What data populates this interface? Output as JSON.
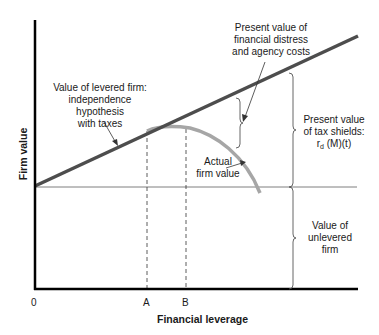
{
  "diagram": {
    "type": "capital-structure-tradeoff",
    "axes": {
      "x_label": "Financial leverage",
      "y_label": "Firm value",
      "x_ticks": [
        "0",
        "A",
        "B"
      ]
    },
    "labels": {
      "levered_line": [
        "Value of levered firm:",
        "independence hypothesis",
        "with taxes"
      ],
      "distress_costs": [
        "Present value of",
        "financial distress",
        "and agency costs"
      ],
      "tax_shields_line1": "Present value",
      "tax_shields_line2": "of tax shields:",
      "tax_shields_formula_r": "r",
      "tax_shields_formula_sub": "d",
      "tax_shields_formula_rest": " (M)(t)",
      "actual_value": [
        "Actual",
        "firm value"
      ],
      "unlevered": [
        "Value of",
        "unlevered",
        "firm"
      ]
    },
    "colors": {
      "levered_line": "#4d4d4d",
      "actual_curve": "#a6a6a6",
      "axis": "#000000",
      "guide": "#808080"
    }
  }
}
